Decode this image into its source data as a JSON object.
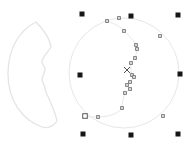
{
  "canvas": {
    "width": 191,
    "height": 148,
    "background": "#ffffff"
  },
  "palette": {
    "clipart_outline": "#e4e4e4",
    "edit_outline": "#e7e7e7",
    "node_fill": "#d6d6d6",
    "node_border": "#6f6f6f",
    "start_node_fill": "#ffffff",
    "start_node_border": "#5a5a5a",
    "handle_color": "#161616",
    "marker_color": "#3c3c3c"
  },
  "objects": {
    "moon_clipart": {
      "name": "moon-with-face-outline",
      "stroke_width": 1.3,
      "path": "M 36,22 C 20,30 8,48 8,74 C 8,100 22,120 42,127 C 48,129 54,126 57,121 C 56,115 53,108 50,101 C 48,96 45,92 45,88 C 45,85 42,83 42,79 C 42,76 45,73 45,69 C 45,66 41,64 42,61 C 43,57 48,52 51,47 C 50,40 44,30 36,22 Z"
    },
    "construction_circle": {
      "name": "construction-circle-outline",
      "cx": 124,
      "cy": 73,
      "r": 55,
      "stroke_width": 1
    },
    "crescent_inner_curve": {
      "name": "crescent-face-curve",
      "stroke_width": 1,
      "path": "M 107,21 C 115,24 121,27 124,31 C 129,36 134,40 136,45 L 137,49 C 137,52 136,55 135,58 L 131,63 C 130,67 131,71 132,75 L 134,77 C 133,79 131,80 130,82 L 127,85 L 130,89 L 125,93 C 123,98 122,103 122,108 C 119,113 109,117 98,117 C 93,117 88,117 85,116"
    }
  },
  "node_editing": {
    "node_size": 2.8,
    "start_node": {
      "x": 85,
      "y": 116,
      "size": 4.6
    },
    "curve_nodes": [
      {
        "x": 107,
        "y": 21
      },
      {
        "x": 119,
        "y": 18
      },
      {
        "x": 160,
        "y": 36
      },
      {
        "x": 163,
        "y": 116
      },
      {
        "x": 124,
        "y": 31
      },
      {
        "x": 136,
        "y": 45
      },
      {
        "x": 137,
        "y": 49
      },
      {
        "x": 135,
        "y": 58
      },
      {
        "x": 131,
        "y": 63
      },
      {
        "x": 132,
        "y": 75
      },
      {
        "x": 134,
        "y": 77
      },
      {
        "x": 130,
        "y": 82
      },
      {
        "x": 127,
        "y": 85
      },
      {
        "x": 130,
        "y": 89
      },
      {
        "x": 125,
        "y": 93
      },
      {
        "x": 122,
        "y": 108
      },
      {
        "x": 98,
        "y": 117
      }
    ]
  },
  "selection": {
    "handle_size": 5,
    "handles": [
      {
        "id": "nw",
        "x": 82,
        "y": 14
      },
      {
        "id": "n",
        "x": 131,
        "y": 16
      },
      {
        "id": "ne",
        "x": 178,
        "y": 15
      },
      {
        "id": "w",
        "x": 80,
        "y": 75
      },
      {
        "id": "e",
        "x": 180,
        "y": 74
      },
      {
        "id": "sw",
        "x": 83,
        "y": 134
      },
      {
        "id": "s",
        "x": 131,
        "y": 135
      },
      {
        "id": "se",
        "x": 178,
        "y": 134
      }
    ],
    "center_marker": {
      "x": 127,
      "y": 70,
      "arm": 3
    }
  }
}
